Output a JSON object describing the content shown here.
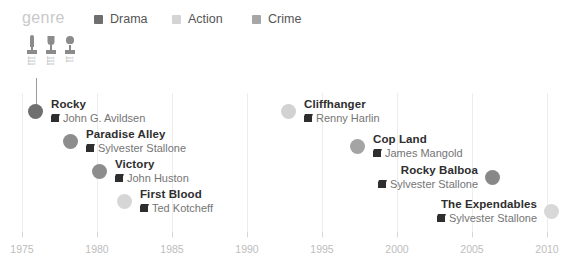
{
  "legend": {
    "title": "genre",
    "items": [
      {
        "label": "Drama",
        "color": "#6f6f6f",
        "x": 94
      },
      {
        "label": "Action",
        "color": "#d4d4d4",
        "x": 172
      },
      {
        "label": "Crime",
        "color": "#a6a6a6",
        "x": 252
      }
    ]
  },
  "awards": [
    {
      "name": "award-statue-icon",
      "caption": "Award Award Award",
      "x": 0
    },
    {
      "name": "award-trophy-icon",
      "caption": "Award Award Award",
      "x": 19
    },
    {
      "name": "award-cup-icon",
      "caption": "Award Award",
      "x": 38
    }
  ],
  "axis": {
    "label": "",
    "ticks": [
      {
        "label": "1975",
        "x": 22
      },
      {
        "label": "1980",
        "x": 97
      },
      {
        "label": "1985",
        "x": 172
      },
      {
        "label": "1990",
        "x": 247
      },
      {
        "label": "1995",
        "x": 322
      },
      {
        "label": "2000",
        "x": 397
      },
      {
        "label": "2005",
        "x": 472
      },
      {
        "label": "2010",
        "x": 547
      }
    ]
  },
  "chart_data": {
    "type": "scatter",
    "title": "",
    "xlabel": "",
    "ylabel": "",
    "xlim": [
      1975,
      2010
    ],
    "grid": true,
    "legend_position": "top",
    "series": [
      {
        "name": "Drama",
        "color": "#6f6f6f"
      },
      {
        "name": "Action",
        "color": "#d4d4d4"
      },
      {
        "name": "Crime",
        "color": "#a6a6a6"
      }
    ],
    "points": [
      {
        "title": "Rocky",
        "director": "John G. Avildsen",
        "year": 1976,
        "genre": "Drama",
        "color": "#6f6f6f",
        "x": 36,
        "y": 111,
        "align": "left",
        "connector": true
      },
      {
        "title": "Paradise Alley",
        "director": "Sylvester Stallone",
        "year": 1978,
        "genre": "Drama",
        "color": "#8d8d8d",
        "x": 71,
        "y": 141,
        "align": "left",
        "connector": false
      },
      {
        "title": "Victory",
        "director": "John Huston",
        "year": 1981,
        "genre": "Drama",
        "color": "#8d8d8d",
        "x": 100,
        "y": 171,
        "align": "left",
        "connector": false
      },
      {
        "title": "First Blood",
        "director": "Ted Kotcheff",
        "year": 1982,
        "genre": "Action",
        "color": "#d6d6d6",
        "x": 125,
        "y": 201,
        "align": "left",
        "connector": false
      },
      {
        "title": "Cliffhanger",
        "director": "Renny Harlin",
        "year": 1993,
        "genre": "Action",
        "color": "#d2d2d2",
        "x": 289,
        "y": 111,
        "align": "left",
        "connector": false
      },
      {
        "title": "Cop Land",
        "director": "James Mangold",
        "year": 1997,
        "genre": "Crime",
        "color": "#a4a4a4",
        "x": 358,
        "y": 146,
        "align": "left",
        "connector": false
      },
      {
        "title": "Rocky Balboa",
        "director": "Sylvester Stallone",
        "year": 2006,
        "genre": "Drama",
        "color": "#888888",
        "x": 492,
        "y": 177,
        "align": "right",
        "connector": false
      },
      {
        "title": "The Expendables",
        "director": "Sylvester Stallone",
        "year": 2010,
        "genre": "Action",
        "color": "#d8d8d8",
        "x": 551,
        "y": 211,
        "align": "right",
        "connector": false
      }
    ]
  }
}
